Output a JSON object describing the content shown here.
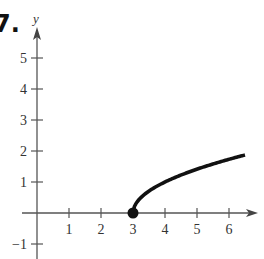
{
  "problem_number": "7.",
  "chart_data": {
    "type": "line",
    "title": "",
    "xlabel": "",
    "ylabel": "y",
    "function": "y = sqrt(x - 3)",
    "x_ticks": [
      1,
      2,
      3,
      4,
      5,
      6
    ],
    "y_ticks": [
      -1,
      1,
      2,
      3,
      4,
      5
    ],
    "xlim": [
      -1,
      7
    ],
    "ylim": [
      -1,
      6
    ],
    "grid": false,
    "series": [
      {
        "name": "curve",
        "x": [
          3,
          3.05,
          3.2,
          3.5,
          4,
          4.5,
          5,
          5.5,
          6,
          6.5
        ],
        "values": [
          0,
          0.22,
          0.45,
          0.71,
          1.0,
          1.22,
          1.41,
          1.58,
          1.73,
          1.87
        ],
        "color": "#111111"
      }
    ],
    "annotations": [
      {
        "type": "closed-point",
        "x": 3,
        "y": 0
      }
    ]
  }
}
